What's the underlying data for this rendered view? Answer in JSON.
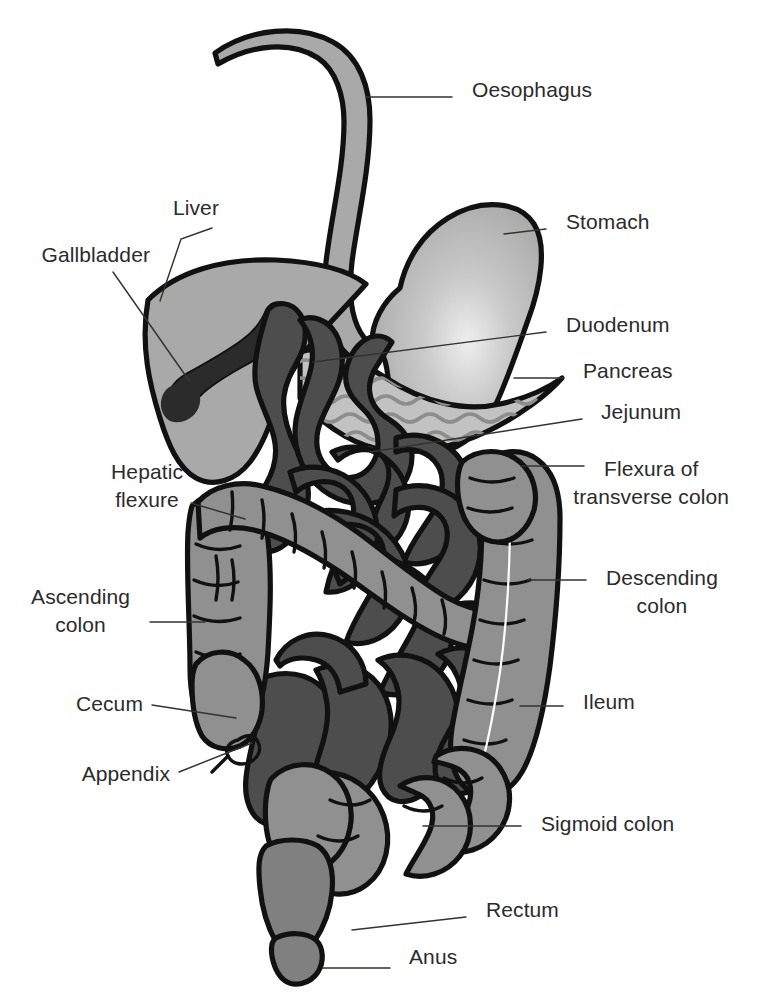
{
  "diagram": {
    "type": "anatomical-diagram",
    "canvas": {
      "width": 769,
      "height": 1007
    },
    "background_color": "#ffffff",
    "palette": {
      "outline": "#111111",
      "organ_light": "#a9a9a9",
      "organ_mid": "#909090",
      "organ_dark": "#4d4d4d",
      "gallbladder": "#2b2b2b",
      "pancreas_fill": "#c2c2c2",
      "pancreas_texture": "#8d8d8d",
      "stomach_highlight": "#e8e8e8",
      "label_text": "#2b2b2b",
      "leader_line": "#33332f"
    },
    "labels": [
      {
        "id": "oesophagus",
        "text": "Oesophagus",
        "side": "right",
        "x": 472,
        "y": 97,
        "leader": "M 366,97 L 452,97"
      },
      {
        "id": "liver",
        "text": "Liver",
        "side": "left",
        "x": 219,
        "y": 215,
        "leader": "M 212,228 L 181,239 L 160,301"
      },
      {
        "id": "gallbladder",
        "text": "Gallbladder",
        "side": "left",
        "x": 150,
        "y": 262,
        "leader": "M 113,272 L 190,382"
      },
      {
        "id": "stomach",
        "text": "Stomach",
        "side": "right",
        "x": 566,
        "y": 229,
        "leader": "M 504,234 L 546,229"
      },
      {
        "id": "duodenum",
        "text": "Duodenum",
        "side": "right",
        "x": 566,
        "y": 332,
        "leader": "M 313,362 L 546,332"
      },
      {
        "id": "pancreas",
        "text": "Pancreas",
        "side": "right",
        "x": 583,
        "y": 378,
        "leader": "M 514,378 L 563,378"
      },
      {
        "id": "jejunum",
        "text": "Jejunum",
        "side": "right",
        "x": 601,
        "y": 419,
        "leader": "M 370,452 L 582,419"
      },
      {
        "id": "flexura",
        "text": "Flexura of",
        "side": "right",
        "x": 604,
        "y": 476,
        "leader": "M 521,466 L 584,466",
        "line2": "transverse colon",
        "line2_y": 504
      },
      {
        "id": "hepatic_flexure",
        "text": "Hepatic",
        "side": "left",
        "x": 183,
        "y": 479,
        "line2": "flexure",
        "line2_y": 507,
        "leader": "M 191,503 L 245,519"
      },
      {
        "id": "descending_colon",
        "text": "Descending",
        "side": "right",
        "x": 606,
        "y": 585,
        "line2": "colon",
        "line2_y": 613,
        "leader": "M 528,580 L 586,580"
      },
      {
        "id": "ascending_colon",
        "text": "Ascending",
        "side": "left",
        "x": 130,
        "y": 604,
        "line2": "colon",
        "line2_y": 632,
        "leader": "M 150,622 L 205,622"
      },
      {
        "id": "ileum",
        "text": "Ileum",
        "side": "right",
        "x": 583,
        "y": 709,
        "leader": "M 520,706 L 563,706"
      },
      {
        "id": "cecum",
        "text": "Cecum",
        "side": "left",
        "x": 143,
        "y": 711,
        "leader": "M 152,705 L 236,718"
      },
      {
        "id": "appendix",
        "text": "Appendix",
        "side": "left",
        "x": 170,
        "y": 781,
        "leader": "M 179,772 L 252,743"
      },
      {
        "id": "sigmoid_colon",
        "text": "Sigmoid colon",
        "side": "right",
        "x": 541,
        "y": 831,
        "leader": "M 423,826 L 521,826"
      },
      {
        "id": "rectum",
        "text": "Rectum",
        "side": "right",
        "x": 486,
        "y": 917,
        "leader": "M 352,930 L 466,917"
      },
      {
        "id": "anus",
        "text": "Anus",
        "side": "right",
        "x": 409,
        "y": 964,
        "leader": "M 322,968 L 390,968"
      }
    ],
    "organs": [
      {
        "id": "oesophagus",
        "name": "Oesophagus",
        "fill": "#a9a9a9"
      },
      {
        "id": "stomach",
        "name": "Stomach",
        "fill": "#b4b4b4"
      },
      {
        "id": "liver",
        "name": "Liver",
        "fill": "#a9a9a9"
      },
      {
        "id": "gallbladder",
        "name": "Gallbladder",
        "fill": "#2b2b2b"
      },
      {
        "id": "duodenum",
        "name": "Duodenum",
        "fill": "#4d4d4d"
      },
      {
        "id": "pancreas",
        "name": "Pancreas",
        "fill": "#c2c2c2"
      },
      {
        "id": "jejunum",
        "name": "Jejunum",
        "fill": "#4d4d4d"
      },
      {
        "id": "ileum",
        "name": "Ileum",
        "fill": "#4d4d4d"
      },
      {
        "id": "transverse",
        "name": "Flexura of transverse colon",
        "fill": "#909090"
      },
      {
        "id": "ascending",
        "name": "Ascending colon",
        "fill": "#909090"
      },
      {
        "id": "descending",
        "name": "Descending colon",
        "fill": "#909090"
      },
      {
        "id": "cecum",
        "name": "Cecum",
        "fill": "#909090"
      },
      {
        "id": "appendix",
        "name": "Appendix",
        "fill": "#909090"
      },
      {
        "id": "sigmoid",
        "name": "Sigmoid colon",
        "fill": "#909090"
      },
      {
        "id": "rectum",
        "name": "Rectum",
        "fill": "#7d7d7d"
      },
      {
        "id": "anus",
        "name": "Anus",
        "fill": "#7d7d7d"
      }
    ]
  }
}
